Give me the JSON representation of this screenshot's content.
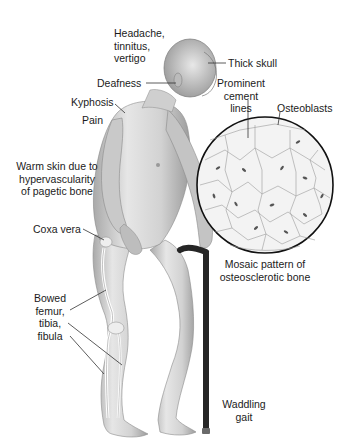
{
  "figure": {
    "labels": {
      "headache": "Headache,\ntinnitus,\nvertigo",
      "thick_skull": "Thick skull",
      "deafness": "Deafness",
      "cement_lines": "Prominent\ncement lines",
      "osteoblasts": "Osteoblasts",
      "kyphosis": "Kyphosis",
      "pain": "Pain",
      "warm_skin": "Warm skin due to\nhypervascularity\nof pagetic bone",
      "coxa_vera": "Coxa vera",
      "bowed_bones": "Bowed\nfemur,\ntibia,\nfibula",
      "mosaic": "Mosaic pattern of\nosteosclerotic bone",
      "gait": "Waddling\ngait"
    },
    "colors": {
      "skin": "#dcdcdc",
      "skin_shadow": "#a8a8a8",
      "cane": "#262626",
      "leader_line": "#333333",
      "circle_outline": "#111111"
    }
  }
}
